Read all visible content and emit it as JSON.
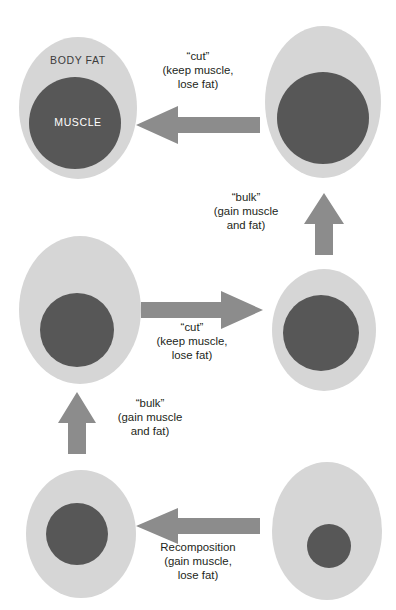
{
  "diagram": {
    "colors": {
      "body_fat": "#d6d6d6",
      "muscle": "#575757",
      "arrow": "#8c8c8c",
      "text": "#231f20",
      "background": "#ffffff"
    },
    "region_labels": {
      "body_fat": "BODY FAT",
      "muscle": "MUSCLE"
    },
    "figures": [
      {
        "id": "lean-muscular",
        "position": "top-left",
        "fat_amount": "low",
        "muscle_amount": "high",
        "labeled": true
      },
      {
        "id": "bulked-large",
        "position": "top-right",
        "fat_amount": "high",
        "muscle_amount": "high",
        "labeled": false
      },
      {
        "id": "mid-bulked",
        "position": "middle-left",
        "fat_amount": "high",
        "muscle_amount": "medium",
        "labeled": false
      },
      {
        "id": "mid-lean",
        "position": "middle-right",
        "fat_amount": "low",
        "muscle_amount": "medium",
        "labeled": false
      },
      {
        "id": "recomposed",
        "position": "bottom-left",
        "fat_amount": "medium",
        "muscle_amount": "medium",
        "labeled": false
      },
      {
        "id": "untrained",
        "position": "bottom-right",
        "fat_amount": "high",
        "muscle_amount": "low",
        "labeled": false
      }
    ],
    "arrows": [
      {
        "id": "cut-top",
        "direction": "left",
        "from": "bulked-large",
        "to": "lean-muscular",
        "label": "“cut”\n(keep muscle,\nlose fat)"
      },
      {
        "id": "bulk-right",
        "direction": "up",
        "from": "mid-lean",
        "to": "bulked-large",
        "label": "“bulk”\n(gain muscle\nand fat)"
      },
      {
        "id": "cut-middle",
        "direction": "right",
        "from": "mid-bulked",
        "to": "mid-lean",
        "label": "“cut”\n(keep muscle,\nlose fat)"
      },
      {
        "id": "bulk-left",
        "direction": "up",
        "from": "recomposed",
        "to": "mid-bulked",
        "label": "“bulk”\n(gain muscle\nand fat)"
      },
      {
        "id": "recomposition",
        "direction": "left",
        "from": "untrained",
        "to": "recomposed",
        "label": "Recomposition\n(gain muscle,\nlose fat)"
      }
    ]
  }
}
